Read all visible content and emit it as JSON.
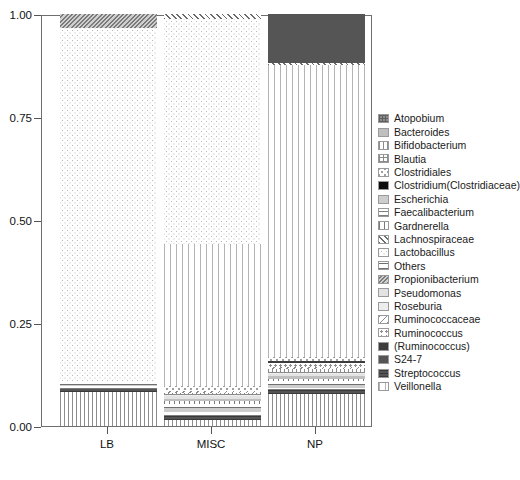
{
  "chart_data": {
    "type": "bar",
    "subtype": "stacked-relative-abundance",
    "title": "",
    "xlabel": "",
    "ylabel": "",
    "ylim": [
      0.0,
      1.0
    ],
    "ytick_labels": [
      "0.00",
      "0.25",
      "0.50",
      "0.75",
      "1.00"
    ],
    "ytick_values": [
      0.0,
      0.25,
      0.5,
      0.75,
      1.0
    ],
    "grid": false,
    "legend_position": "right",
    "categories": [
      "LB",
      "MISC",
      "NP"
    ],
    "series": [
      {
        "name": "Atopobium",
        "pattern": "grid-dark",
        "values": [
          0.0,
          0.0,
          0.0
        ]
      },
      {
        "name": "Bacteroides",
        "pattern": "solid-light",
        "values": [
          0.0,
          0.005,
          0.006
        ]
      },
      {
        "name": "Bifidobacterium",
        "pattern": "vline-thin",
        "values": [
          0.082,
          0.015,
          0.078
        ]
      },
      {
        "name": "Blautia",
        "pattern": "grid",
        "values": [
          0.0,
          0.004,
          0.008
        ]
      },
      {
        "name": "Clostridiales",
        "pattern": "stipple-coarse",
        "values": [
          0.0,
          0.012,
          0.01
        ]
      },
      {
        "name": "Clostridium(Clostridiaceae)",
        "pattern": "solid-black",
        "values": [
          0.0,
          0.0,
          0.0
        ]
      },
      {
        "name": "Escherichia",
        "pattern": "solid-pale",
        "values": [
          0.004,
          0.01,
          0.006
        ]
      },
      {
        "name": "Faecalibacterium",
        "pattern": "hline",
        "values": [
          0.006,
          0.008,
          0.006
        ]
      },
      {
        "name": "Gardnerella",
        "pattern": "vline-med",
        "values": [
          0.0,
          0.008,
          0.006
        ]
      },
      {
        "name": "Lachnospiraceae",
        "pattern": "diag-f",
        "values": [
          0.0,
          0.012,
          0.006
        ]
      },
      {
        "name": "Lactobacillus",
        "pattern": "stipple",
        "values": [
          0.855,
          0.545,
          0.0
        ]
      },
      {
        "name": "Others",
        "pattern": "hline-wide",
        "values": [
          0.01,
          0.01,
          0.01
        ]
      },
      {
        "name": "Propionibacterium",
        "pattern": "diag-dense",
        "values": [
          0.035,
          0.0,
          0.0
        ]
      },
      {
        "name": "Pseudomonas",
        "pattern": "solid-vpale",
        "values": [
          0.0,
          0.006,
          0.005
        ]
      },
      {
        "name": "Roseburia",
        "pattern": "solid-rose",
        "values": [
          0.0,
          0.004,
          0.004
        ]
      },
      {
        "name": "Ruminococcaceae",
        "pattern": "diag-b",
        "values": [
          0.0,
          0.006,
          0.006
        ]
      },
      {
        "name": "Ruminococcus",
        "pattern": "dots-sparse",
        "values": [
          0.0,
          0.0,
          0.01
        ]
      },
      {
        "name": "(Ruminococcus)",
        "pattern": "solid-dark",
        "values": [
          0.0,
          0.0,
          0.004
        ]
      },
      {
        "name": "S24-7",
        "pattern": "solid-s247",
        "values": [
          0.0,
          0.0,
          0.118
        ]
      },
      {
        "name": "Streptococcus",
        "pattern": "strep",
        "values": [
          0.008,
          0.01,
          0.009
        ]
      },
      {
        "name": "Veillonella",
        "pattern": "vline-wide",
        "values": [
          0.0,
          0.345,
          0.708
        ]
      }
    ]
  },
  "axes": {
    "y_ticks": [
      {
        "label": "1.00",
        "value": 1.0
      },
      {
        "label": "0.75",
        "value": 0.75
      },
      {
        "label": "0.50",
        "value": 0.5
      },
      {
        "label": "0.25",
        "value": 0.25
      },
      {
        "label": "0.00",
        "value": 0.0
      }
    ],
    "x_ticks": [
      {
        "label": "LB"
      },
      {
        "label": "MISC"
      },
      {
        "label": "NP"
      }
    ]
  },
  "legend": {
    "items": [
      {
        "label": "Atopobium",
        "swatch": "grid-dark"
      },
      {
        "label": "Bacteroides",
        "swatch": "solid-light"
      },
      {
        "label": "Bifidobacterium",
        "swatch": "vline-thin"
      },
      {
        "label": "Blautia",
        "swatch": "grid"
      },
      {
        "label": "Clostridiales",
        "swatch": "stipple-coarse"
      },
      {
        "label": "Clostridium(Clostridiaceae)",
        "swatch": "solid-black"
      },
      {
        "label": "Escherichia",
        "swatch": "solid-pale"
      },
      {
        "label": "Faecalibacterium",
        "swatch": "hline"
      },
      {
        "label": "Gardnerella",
        "swatch": "vline-med"
      },
      {
        "label": "Lachnospiraceae",
        "swatch": "diag-f"
      },
      {
        "label": "Lactobacillus",
        "swatch": "stipple"
      },
      {
        "label": "Others",
        "swatch": "hline-wide"
      },
      {
        "label": "Propionibacterium",
        "swatch": "diag-dense"
      },
      {
        "label": "Pseudomonas",
        "swatch": "solid-vpale"
      },
      {
        "label": "Roseburia",
        "swatch": "solid-rose"
      },
      {
        "label": "Ruminococcaceae",
        "swatch": "diag-b"
      },
      {
        "label": "Ruminococcus",
        "swatch": "dots-sparse"
      },
      {
        "label": "(Ruminococcus)",
        "swatch": "solid-dark"
      },
      {
        "label": "S24-7",
        "swatch": "solid-s247"
      },
      {
        "label": "Streptococcus",
        "swatch": "strep"
      },
      {
        "label": "Veillonella",
        "swatch": "vline-wide"
      }
    ]
  }
}
